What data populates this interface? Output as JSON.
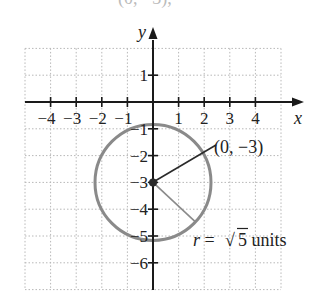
{
  "figure": {
    "partial_top_text": "(0, −3),",
    "axes": {
      "x_label": "x",
      "y_label": "y",
      "x_ticks": [
        {
          "value": -4,
          "label": "−4"
        },
        {
          "value": -3,
          "label": "−3"
        },
        {
          "value": -2,
          "label": "−2"
        },
        {
          "value": -1,
          "label": "−1"
        },
        {
          "value": 1,
          "label": "1"
        },
        {
          "value": 2,
          "label": "2"
        },
        {
          "value": 3,
          "label": "3"
        },
        {
          "value": 4,
          "label": "4"
        }
      ],
      "y_ticks": [
        {
          "value": 1,
          "label": "1"
        },
        {
          "value": -1,
          "label": "−1"
        },
        {
          "value": -2,
          "label": "−2"
        },
        {
          "value": -3,
          "label": "−3"
        },
        {
          "value": -4,
          "label": "−4"
        },
        {
          "value": -5,
          "label": "−5"
        },
        {
          "value": -6,
          "label": "−6"
        }
      ],
      "grid": {
        "x_min": -5,
        "x_max": 5,
        "y_min": -7,
        "y_max": 2
      }
    },
    "circle": {
      "center": {
        "x": 0,
        "y": -3
      },
      "radius_value": 2.236,
      "color": "#8a8a8a"
    },
    "annotations": {
      "center_label": "(0, −3)",
      "radius_label_prefix": "r = ",
      "radius_label_sqrt": "√",
      "radius_label_value": "5",
      "radius_label_suffix": " units"
    },
    "colors": {
      "axis": "#1a1a1a",
      "grid": "#b8b8b8",
      "circle": "#8a8a8a",
      "leader": "#2a2a2a",
      "radius_line": "#8a8a8a"
    }
  }
}
